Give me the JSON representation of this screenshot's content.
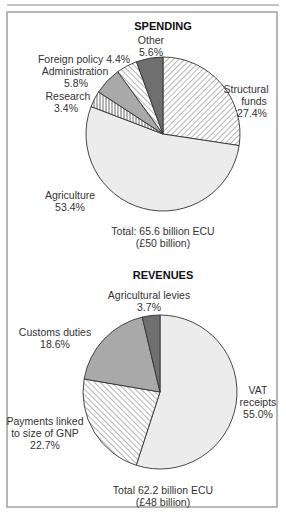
{
  "chart_data": [
    {
      "type": "pie",
      "title": "SPENDING",
      "total_line1": "Total: 65.6 billion ECU",
      "total_line2": "(£50 billion)",
      "start": "12 o'clock",
      "direction": "clockwise",
      "slices": [
        {
          "name": "Structural funds",
          "value": 27.4,
          "label_lines": [
            "Structural",
            "funds",
            "27.4%"
          ],
          "fill": "hatch-down",
          "color": "#ffffff"
        },
        {
          "name": "Agriculture",
          "value": 53.4,
          "label_lines": [
            "Agriculture",
            "53.4%"
          ],
          "fill": "solid",
          "color": "#ececec"
        },
        {
          "name": "Research",
          "value": 3.4,
          "label_lines": [
            "Research",
            "3.4%"
          ],
          "fill": "vertical",
          "color": "#ffffff"
        },
        {
          "name": "Administration",
          "value": 5.8,
          "label_lines": [
            "Administration",
            "5.8%"
          ],
          "fill": "solid",
          "color": "#a9a9a9"
        },
        {
          "name": "Foreign policy",
          "value": 4.4,
          "label_lines": [
            "Foreign policy 4.4%"
          ],
          "fill": "hatch-up",
          "color": "#ffffff"
        },
        {
          "name": "Other",
          "value": 5.6,
          "label_lines": [
            "Other",
            "5.6%"
          ],
          "fill": "solid",
          "color": "#6f6f6f"
        }
      ]
    },
    {
      "type": "pie",
      "title": "REVENUES",
      "total_line1": "Total 62.2 billion ECU",
      "total_line2": "(£48 billion)",
      "start": "12 o'clock",
      "direction": "clockwise",
      "slices": [
        {
          "name": "VAT receipts",
          "value": 55.0,
          "label_lines": [
            "VAT",
            "receipts",
            "55.0%"
          ],
          "fill": "solid",
          "color": "#ececec"
        },
        {
          "name": "Payments linked to size of GNP",
          "value": 22.7,
          "label_lines": [
            "Payments linked",
            "to size of GNP",
            "22.7%"
          ],
          "fill": "hatch-up",
          "color": "#ffffff"
        },
        {
          "name": "Customs duties",
          "value": 18.6,
          "label_lines": [
            "Customs duties",
            "18.6%"
          ],
          "fill": "solid",
          "color": "#a9a9a9"
        },
        {
          "name": "Agricultural levies",
          "value": 3.7,
          "label_lines": [
            "Agricultural levies",
            "3.7%"
          ],
          "fill": "solid",
          "color": "#6f6f6f"
        }
      ]
    }
  ]
}
